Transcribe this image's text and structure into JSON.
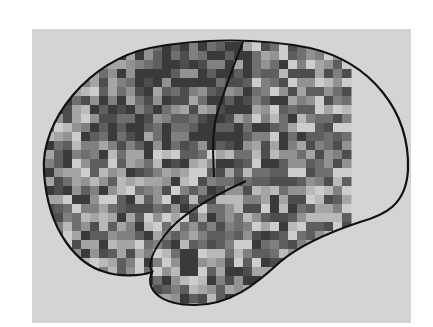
{
  "figure": {
    "colors": {
      "page_background": "#ffffff",
      "frame_background": "#d4d4d4",
      "outline": "#111111",
      "palette": [
        "#3a3a3a",
        "#4d4d4d",
        "#5e5e5e",
        "#6f6f6f",
        "#808080",
        "#929292",
        "#a5a5a5",
        "#b9b9b9",
        "#cdcdcd"
      ]
    },
    "frame": {
      "x": 32,
      "y": 29,
      "width": 379,
      "height": 294
    },
    "heatmap": {
      "x": 45,
      "y": 42,
      "width": 306,
      "height": 265,
      "cell": 9,
      "seed": 7
    },
    "outline_label": "brain-outline",
    "structures": [
      "brain-outline",
      "central-sulcus",
      "sylvian-fissure",
      "temporal-lobe"
    ]
  }
}
